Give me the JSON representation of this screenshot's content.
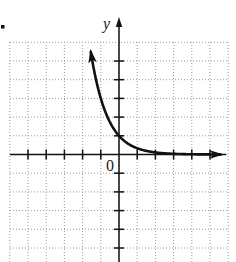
{
  "chart_data": {
    "type": "line",
    "title": "",
    "xlabel": "",
    "ylabel": "y",
    "origin_label": "0",
    "function": "y = (1/3)^x",
    "series": [
      {
        "name": "y = (1/3)^x",
        "x": [
          -1.6,
          -1.33,
          -1.0,
          -0.72,
          -0.5,
          0,
          0.5,
          1,
          2,
          3,
          4,
          5
        ],
        "y": [
          5.8,
          4.3,
          3.0,
          2.2,
          1.73,
          1.0,
          0.58,
          0.33,
          0.11,
          0.04,
          0.01,
          0.004
        ]
      }
    ],
    "key_points": [
      {
        "x": 0,
        "y": 1
      },
      {
        "x": 1,
        "y": 0.33
      },
      {
        "x": -1,
        "y": 3
      }
    ],
    "xlim": [
      -6,
      6
    ],
    "ylim": [
      -5.8,
      6
    ],
    "x_ticks": [
      -5,
      -4,
      -3,
      -2,
      -1,
      1,
      2,
      3,
      4,
      5
    ],
    "y_ticks": [
      -5,
      -4,
      -3,
      -2,
      -1,
      1,
      2,
      3,
      4,
      5
    ],
    "tick_labels_shown": false,
    "grid": true,
    "grid_style": "dotted",
    "arrows": {
      "curve_left_end": true,
      "curve_right_end": true,
      "y_axis_top": true
    },
    "colors": {
      "curve": "#111111",
      "axes": "#111111",
      "grid": "#9a9a9a"
    }
  },
  "marker": "•"
}
